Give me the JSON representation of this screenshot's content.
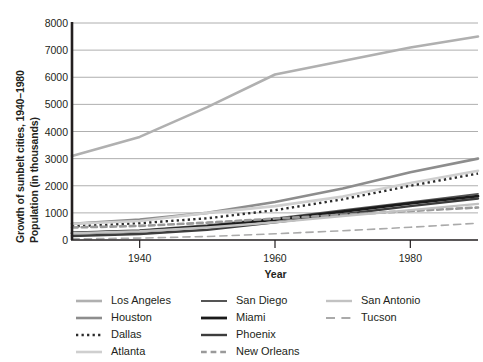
{
  "chart_data": {
    "type": "line",
    "title": "",
    "ylabel_line1": "Growth of sunbelt cities, 1940–1980",
    "ylabel_line2": "Population (in thousands)",
    "xlabel": "Year",
    "xlim": [
      1930,
      1990
    ],
    "ylim": [
      0,
      8000
    ],
    "xticks": [
      1940,
      1960,
      1980
    ],
    "xtick_labels": [
      "1940",
      "1960",
      "1980"
    ],
    "yticks": [
      0,
      1000,
      2000,
      3000,
      4000,
      5000,
      6000,
      7000,
      8000
    ],
    "ytick_labels": [
      "0",
      "1000",
      "2000",
      "3000",
      "4000",
      "5000",
      "6000",
      "7000",
      "8000"
    ],
    "grid": "horizontal",
    "legend_position": "bottom",
    "x": [
      1930,
      1940,
      1950,
      1960,
      1970,
      1980,
      1990
    ],
    "series": [
      {
        "name": "Los Angeles",
        "color": "#b0b0b0",
        "width": 2.6,
        "dash": "solid",
        "values": [
          3100,
          3800,
          4900,
          6100,
          6600,
          7100,
          7500
        ]
      },
      {
        "name": "Houston",
        "color": "#8d8d8d",
        "width": 2.6,
        "dash": "solid",
        "values": [
          600,
          750,
          1000,
          1400,
          1900,
          2500,
          3000
        ]
      },
      {
        "name": "Dallas",
        "color": "#2b2b2b",
        "width": 2.4,
        "dash": "dotted",
        "values": [
          500,
          620,
          800,
          1100,
          1500,
          2000,
          2450
        ]
      },
      {
        "name": "Atlanta",
        "color": "#cfcfcf",
        "width": 2.6,
        "dash": "solid",
        "values": [
          600,
          700,
          1000,
          1250,
          1600,
          2100,
          2550
        ]
      },
      {
        "name": "San Diego",
        "color": "#555555",
        "width": 1.8,
        "dash": "solid",
        "values": [
          280,
          360,
          550,
          800,
          1100,
          1400,
          1700
        ]
      },
      {
        "name": "Miami",
        "color": "#1a1a1a",
        "width": 2.8,
        "dash": "solid",
        "values": [
          250,
          330,
          500,
          750,
          1050,
          1350,
          1620
        ]
      },
      {
        "name": "Phoenix",
        "color": "#3d3d3d",
        "width": 2.4,
        "dash": "solid",
        "values": [
          150,
          220,
          380,
          650,
          950,
          1250,
          1530
        ]
      },
      {
        "name": "New Orleans",
        "color": "#9a9a9a",
        "width": 2.6,
        "dash": "dashed",
        "values": [
          460,
          520,
          640,
          790,
          930,
          1070,
          1200
        ]
      },
      {
        "name": "San Antonio",
        "color": "#c2c2c2",
        "width": 2.4,
        "dash": "solid",
        "values": [
          250,
          320,
          460,
          650,
          880,
          1100,
          1330
        ]
      },
      {
        "name": "Tucson",
        "color": "#aaaaaa",
        "width": 1.6,
        "dash": "dashdot",
        "values": [
          40,
          70,
          130,
          230,
          340,
          470,
          620
        ]
      }
    ]
  },
  "legend": {
    "columns": [
      {
        "items": [
          {
            "label": "Los Angeles",
            "series": "Los Angeles"
          },
          {
            "label": "Houston",
            "series": "Houston"
          },
          {
            "label": "Dallas",
            "series": "Dallas"
          },
          {
            "label": "Atlanta",
            "series": "Atlanta"
          }
        ]
      },
      {
        "items": [
          {
            "label": "San Diego",
            "series": "San Diego"
          },
          {
            "label": "Miami",
            "series": "Miami"
          },
          {
            "label": "Phoenix",
            "series": "Phoenix"
          },
          {
            "label": "New Orleans",
            "series": "New Orleans"
          }
        ]
      },
      {
        "items": [
          {
            "label": "San Antonio",
            "series": "San Antonio"
          },
          {
            "label": "Tucson",
            "series": "Tucson"
          }
        ]
      }
    ]
  },
  "style": {
    "background": "#ffffff",
    "axis_color": "#231f20",
    "grid_color": "#9a9a9a",
    "text_color": "#231f20"
  }
}
